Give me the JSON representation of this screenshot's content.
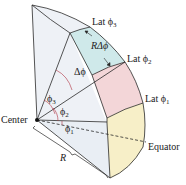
{
  "diagram": {
    "type": "spherical-wedge-latitude",
    "labels": {
      "lat3": "Lat ϕ",
      "lat3_sub": "3",
      "lat2": "Lat ϕ",
      "lat2_sub": "2",
      "lat1": "Lat ϕ",
      "lat1_sub": "1",
      "arc_length": "RΔϕ",
      "delta_phi": "Δϕ",
      "phi3": "ϕ",
      "phi3_sub": "3",
      "phi2": "ϕ",
      "phi2_sub": "2",
      "phi1": "ϕ",
      "phi1_sub": "1",
      "center": "Center",
      "equator": "Equator",
      "radius": "R"
    },
    "colors": {
      "band_top": "#cfe9ea",
      "band_mid": "#f3d6d8",
      "band_bottom": "#f7efc8",
      "face": "#e9eef4",
      "side": "#eef1f6",
      "outline": "#2a2a2a",
      "angle_arc": "#b03040"
    }
  }
}
